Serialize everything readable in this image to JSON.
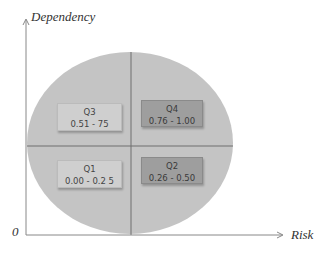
{
  "diagram": {
    "type": "quadrant",
    "axes": {
      "y_label": "Dependency",
      "x_label": "Risk",
      "origin_label": "0"
    },
    "quadrants": [
      {
        "id": "q3",
        "name": "Q3",
        "range": "0.51 - 75",
        "position": "top-left",
        "shade": "light"
      },
      {
        "id": "q4",
        "name": "Q4",
        "range": "0.76  - 1.00",
        "position": "top-right",
        "shade": "dark"
      },
      {
        "id": "q1",
        "name": "Q1",
        "range": "0.00  - 0.2 5",
        "position": "bottom-left",
        "shade": "light"
      },
      {
        "id": "q2",
        "name": "Q2",
        "range": "0.26  - 0.50",
        "position": "bottom-right",
        "shade": "dark"
      }
    ],
    "colors": {
      "ellipse_fill": "#c4c4c4",
      "divider": "#6e6e6e",
      "axis": "#888888",
      "box_light": "#cfcfcf",
      "box_dark": "#9e9e9e"
    }
  }
}
